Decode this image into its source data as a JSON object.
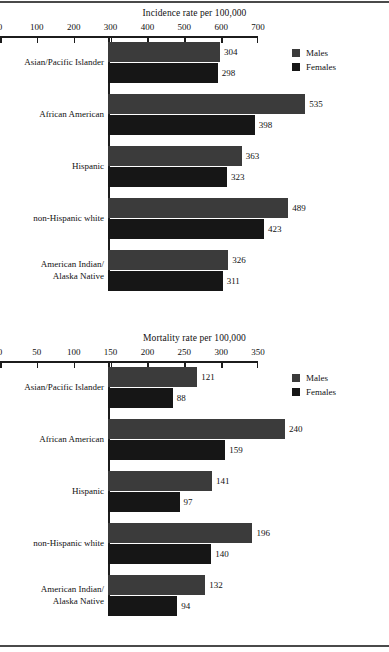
{
  "page": {
    "rule_color": "#4a4a4a"
  },
  "legend": {
    "males_label": "Males",
    "females_label": "Females",
    "males_color": "#3b3b3b",
    "females_color": "#161616"
  },
  "chart_data": [
    {
      "id": "incidence",
      "type": "bar",
      "orientation": "horizontal",
      "title": "Incidence rate per 100,000",
      "xlabel": "",
      "ylabel": "",
      "xlim": [
        0,
        700
      ],
      "xticks": [
        0,
        100,
        200,
        300,
        400,
        500,
        600,
        700
      ],
      "xticklabels": [
        "0",
        "100",
        "200",
        "300",
        "400",
        "500",
        "600",
        "700"
      ],
      "grid": false,
      "legend_position": "upper right",
      "categories": [
        "Asian/Pacific Islander",
        "African American",
        "Hispanic",
        "non-Hispanic white",
        "American Indian/\nAlaska Native"
      ],
      "category_lines": [
        [
          "Asian/Pacific Islander"
        ],
        [
          "African American"
        ],
        [
          "Hispanic"
        ],
        [
          "non-Hispanic white"
        ],
        [
          "American Indian/",
          "Alaska Native"
        ]
      ],
      "series": [
        {
          "name": "Males",
          "values": [
            304,
            535,
            363,
            489,
            326
          ]
        },
        {
          "name": "Females",
          "values": [
            298,
            398,
            323,
            423,
            311
          ]
        }
      ]
    },
    {
      "id": "mortality",
      "type": "bar",
      "orientation": "horizontal",
      "title": "Mortality rate per 100,000",
      "xlabel": "",
      "ylabel": "",
      "xlim": [
        0,
        350
      ],
      "xticks": [
        0,
        50,
        100,
        150,
        200,
        250,
        300,
        350
      ],
      "xticklabels": [
        "0",
        "50",
        "100",
        "150",
        "200",
        "250",
        "300",
        "350"
      ],
      "grid": false,
      "legend_position": "upper right",
      "categories": [
        "Asian/Pacific Islander",
        "African American",
        "Hispanic",
        "non-Hispanic white",
        "American Indian/\nAlaska Native"
      ],
      "category_lines": [
        [
          "Asian/Pacific Islander"
        ],
        [
          "African American"
        ],
        [
          "Hispanic"
        ],
        [
          "non-Hispanic white"
        ],
        [
          "American Indian/",
          "Alaska Native"
        ]
      ],
      "series": [
        {
          "name": "Males",
          "values": [
            121,
            240,
            141,
            196,
            132
          ]
        },
        {
          "name": "Females",
          "values": [
            88,
            159,
            97,
            140,
            94
          ]
        }
      ]
    }
  ]
}
